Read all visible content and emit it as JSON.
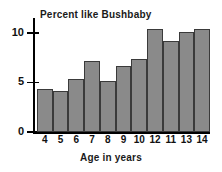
{
  "chart_data": {
    "type": "bar",
    "title": "Percent like Bushbaby",
    "xlabel": "Age in years",
    "ylabel": "",
    "categories": [
      "4",
      "5",
      "6",
      "7",
      "8",
      "9",
      "10",
      "12",
      "11",
      "13",
      "14"
    ],
    "values": [
      4.3,
      4.1,
      5.3,
      7.2,
      5.1,
      6.7,
      7.4,
      10.4,
      9.2,
      10.1,
      10.4
    ],
    "ylim": [
      0,
      11.5
    ],
    "yticks": [
      0,
      5,
      10
    ],
    "ytick_labels": [
      "0",
      "5",
      "10"
    ],
    "grid": false,
    "legend": false,
    "bar_color": "#8a8a8a",
    "bar_edge_color": "#3a3a3a",
    "axis_color": "#000000",
    "background_color": "#ffffff"
  }
}
